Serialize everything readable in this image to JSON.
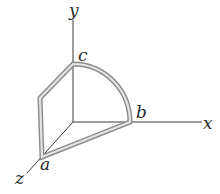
{
  "diagram": {
    "type": "3d-coordinate-axes-with-wire-path",
    "axes": {
      "x": {
        "label": "x"
      },
      "y": {
        "label": "y"
      },
      "z": {
        "label": "z"
      }
    },
    "points": {
      "a": {
        "label": "a"
      },
      "b": {
        "label": "b"
      },
      "c": {
        "label": "c"
      }
    },
    "colors": {
      "axis": "#3a3a3a",
      "wire_outline": "#8a8a8a",
      "wire_fill": "#e4e4e4",
      "text": "#2a2a2a"
    }
  }
}
